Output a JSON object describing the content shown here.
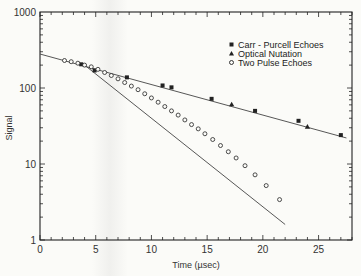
{
  "chart_data": {
    "type": "scatter",
    "title": "",
    "xlabel": "Time (µsec)",
    "ylabel": "Signal",
    "xlim": [
      0,
      28
    ],
    "ylim": [
      1,
      1000
    ],
    "yscale": "log",
    "x_ticks": [
      0,
      5,
      10,
      15,
      20,
      25
    ],
    "y_ticks": [
      1,
      10,
      100,
      1000
    ],
    "grid": false,
    "legend_position": "upper right",
    "series": [
      {
        "name": "Carr - Purcell Echoes",
        "marker": "filled-square",
        "x": [
          3.7,
          4.9,
          7.8,
          11.0,
          11.8,
          15.4,
          19.3,
          23.2,
          27.0
        ],
        "y": [
          205,
          170,
          138,
          108,
          102,
          72,
          50,
          37,
          24
        ]
      },
      {
        "name": "Optical Nutation",
        "marker": "filled-triangle",
        "x": [
          17.2,
          24.0
        ],
        "y": [
          61,
          31
        ]
      },
      {
        "name": "Two Pulse Echoes",
        "marker": "open-circle",
        "x": [
          2.2,
          2.8,
          3.4,
          4.0,
          4.6,
          5.2,
          5.8,
          6.4,
          7.0,
          7.6,
          8.2,
          8.8,
          9.4,
          10.0,
          10.6,
          11.2,
          11.8,
          12.4,
          13.0,
          13.6,
          14.2,
          14.8,
          15.5,
          16.2,
          16.9,
          17.6,
          18.4,
          19.3,
          20.3,
          21.5
        ],
        "y": [
          230,
          222,
          212,
          200,
          190,
          176,
          160,
          146,
          132,
          118,
          106,
          95,
          84,
          74,
          65,
          57,
          50,
          44,
          38,
          33,
          29,
          25,
          21,
          17.5,
          14.5,
          12,
          9.5,
          7.2,
          5.2,
          3.4
        ]
      }
    ],
    "fit_lines": [
      {
        "name": "Carr-Purcell / Optical Nutation fit",
        "from": [
          0,
          280
        ],
        "to": [
          27.5,
          22
        ]
      },
      {
        "name": "Two Pulse Echoes fit",
        "from": [
          4.0,
          200
        ],
        "to": [
          22.0,
          1.6
        ]
      }
    ]
  },
  "axes": {
    "x_title": "Time (µsec)",
    "y_title": "Signal",
    "x_tick_labels": [
      "0",
      "5",
      "10",
      "15",
      "20",
      "25"
    ],
    "y_tick_labels": [
      "1",
      "10",
      "100",
      "1000"
    ]
  },
  "legend": {
    "items": [
      {
        "label": "Carr - Purcell Echoes",
        "marker": "filled-square"
      },
      {
        "label": "Optical Nutation",
        "marker": "filled-triangle"
      },
      {
        "label": "Two Pulse Echoes",
        "marker": "open-circle"
      }
    ]
  },
  "colors": {
    "ink": "#222222",
    "line": "#444444",
    "background": "#fbfbf8"
  }
}
